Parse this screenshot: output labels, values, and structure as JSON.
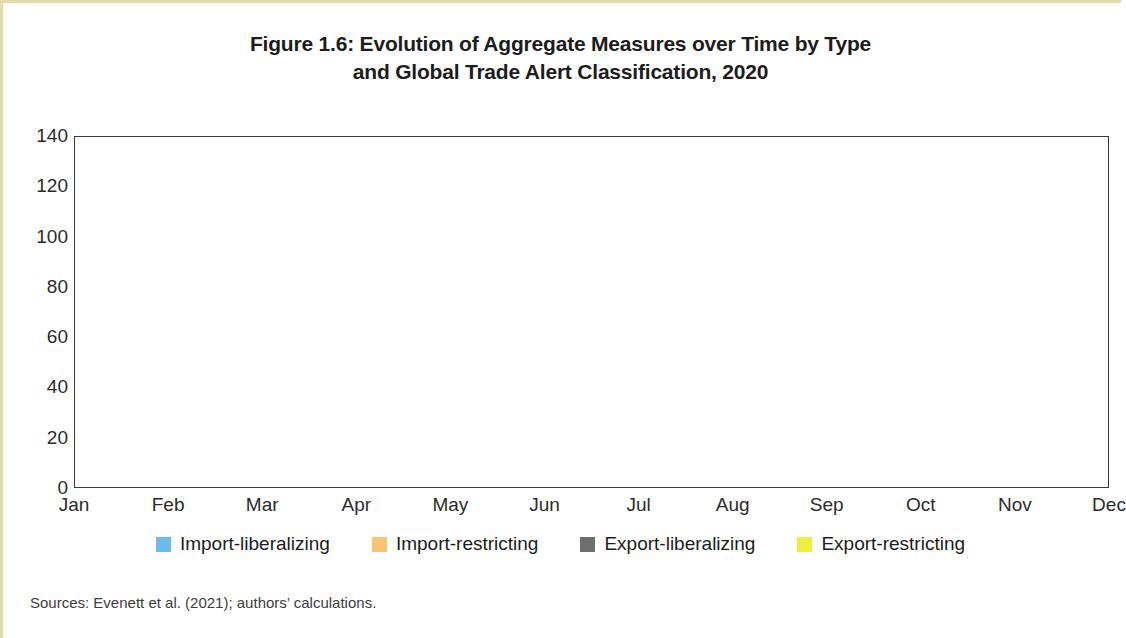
{
  "figure": {
    "title_line1": "Figure 1.6: Evolution of Aggregate Measures over Time by Type",
    "title_line2": "and Global Trade Alert Classification, 2020",
    "source_note": "Sources: Evenett et al. (2021); authors’ calculations."
  },
  "colors": {
    "import_liberalizing": "#6BBCE8",
    "import_restricting": "#F7C570",
    "export_liberalizing": "#6E6E6E",
    "export_restricting": "#EEEE3C",
    "axis": "#3a3a3a",
    "text": "#1c1c1c",
    "page_accent": "#e8d9a8"
  },
  "chart_data": {
    "type": "area",
    "stacked": true,
    "title": "Figure 1.6: Evolution of Aggregate Measures over Time by Type and Global Trade Alert Classification, 2020",
    "xlabel": "",
    "ylabel": "",
    "x": [
      "Jan",
      "Feb",
      "Mar",
      "Apr",
      "May",
      "Jun",
      "Jul",
      "Aug",
      "Sep",
      "Oct",
      "Nov",
      "Dec"
    ],
    "categories": [
      "Jan",
      "Feb",
      "Mar",
      "Apr",
      "May",
      "Jun",
      "Jul",
      "Aug",
      "Sep",
      "Oct",
      "Nov",
      "Dec"
    ],
    "ylim": [
      0,
      140
    ],
    "yticks": [
      0,
      20,
      40,
      60,
      80,
      100,
      120,
      140
    ],
    "ytick_labels": [
      "0",
      "20",
      "40",
      "60",
      "80",
      "100",
      "120",
      "140"
    ],
    "grid": false,
    "legend_position": "bottom",
    "series": [
      {
        "name": "Import-liberalizing",
        "color": "#6BBCE8",
        "values": [
          3,
          3,
          75,
          25,
          3,
          3,
          2,
          2,
          7,
          2,
          0,
          0.5
        ]
      },
      {
        "name": "Import-restricting",
        "color": "#F7C570",
        "values": [
          0.5,
          0.5,
          25,
          10,
          5.5,
          5.5,
          1.5,
          5,
          1.5,
          0.5,
          0,
          1.5
        ]
      },
      {
        "name": "Export-liberalizing",
        "color": "#6E6E6E",
        "values": [
          0,
          0,
          1.5,
          1.5,
          0.5,
          0.5,
          0.5,
          13,
          0.5,
          0,
          0,
          0.2
        ]
      },
      {
        "name": "Export-restricting",
        "color": "#EEEE3C",
        "values": [
          1,
          1,
          14,
          3,
          2,
          2,
          0.5,
          2,
          1,
          0.5,
          0,
          1
        ]
      }
    ]
  },
  "legend": {
    "items": [
      {
        "label": "Import-liberalizing",
        "color": "#6BBCE8",
        "swatch": "legend-swatch-import-liberalizing"
      },
      {
        "label": "Import-restricting",
        "color": "#F7C570",
        "swatch": "legend-swatch-import-restricting"
      },
      {
        "label": "Export-liberalizing",
        "color": "#6E6E6E",
        "swatch": "legend-swatch-export-liberalizing"
      },
      {
        "label": "Export-restricting",
        "color": "#EEEE3C",
        "swatch": "legend-swatch-export-restricting"
      }
    ]
  }
}
